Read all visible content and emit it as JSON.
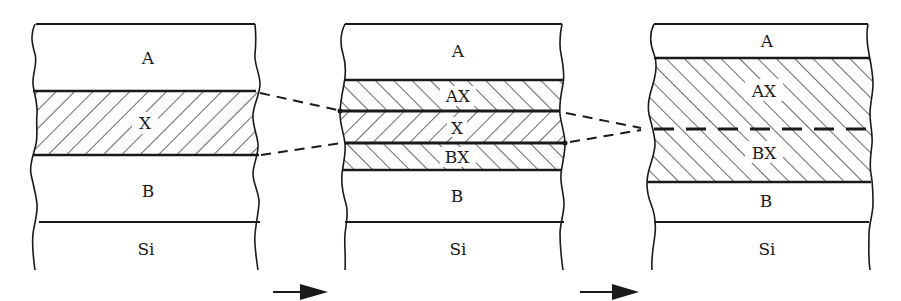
{
  "diagram": {
    "colors": {
      "line": "#1a1a1a",
      "background": "#ffffff"
    },
    "panels": [
      {
        "id": "initial",
        "layers": [
          {
            "label": "A",
            "hatched": false
          },
          {
            "label": "X",
            "hatched": true,
            "hatch": "forward"
          },
          {
            "label": "B",
            "hatched": false
          },
          {
            "label": "Si",
            "hatched": false
          }
        ]
      },
      {
        "id": "intermediate",
        "layers": [
          {
            "label": "A",
            "hatched": false
          },
          {
            "label": "AX",
            "hatched": true,
            "hatch": "back"
          },
          {
            "label": "X",
            "hatched": true,
            "hatch": "forward"
          },
          {
            "label": "BX",
            "hatched": true,
            "hatch": "back"
          },
          {
            "label": "B",
            "hatched": false
          },
          {
            "label": "Si",
            "hatched": false
          }
        ]
      },
      {
        "id": "final",
        "layers": [
          {
            "label": "A",
            "hatched": false
          },
          {
            "label": "AX",
            "hatched": true,
            "hatch": "back"
          },
          {
            "label": "BX",
            "hatched": true,
            "hatch": "back"
          },
          {
            "label": "B",
            "hatched": false
          },
          {
            "label": "Si",
            "hatched": false
          }
        ],
        "dashed_interface": "AX/BX"
      }
    ],
    "arrows": [
      {
        "from": "initial",
        "to": "intermediate",
        "direction": "right"
      },
      {
        "from": "intermediate",
        "to": "final",
        "direction": "right"
      }
    ],
    "connectors": [
      {
        "type": "dashed",
        "from": "X layer (panel 1)",
        "to": "X layer (panel 2)"
      },
      {
        "type": "dashed",
        "from": "X layer (panel 2)",
        "to": "AX/BX interface (panel 3)"
      }
    ]
  }
}
